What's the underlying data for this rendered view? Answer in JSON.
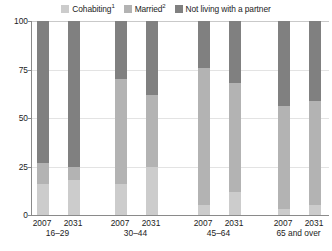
{
  "legend": {
    "items": [
      {
        "label": "Cohabiting",
        "sup": "1",
        "color": "#cccccc",
        "key": "cohabiting"
      },
      {
        "label": "Married",
        "sup": "2",
        "color": "#b3b3b3",
        "key": "married"
      },
      {
        "label": "Not living with a partner",
        "sup": "",
        "color": "#808080",
        "key": "not_living"
      }
    ]
  },
  "axis": {
    "y_ticks": [
      "0",
      "25",
      "50",
      "75",
      "100"
    ],
    "y_min": 0,
    "y_max": 100
  },
  "groups": [
    {
      "age_label": "16–29",
      "bars": [
        {
          "year": "2007",
          "cohabiting": 16,
          "married": 11,
          "not_living": 73
        },
        {
          "year": "2031",
          "cohabiting": 18,
          "married": 7,
          "not_living": 75
        }
      ]
    },
    {
      "age_label": "30–44",
      "bars": [
        {
          "year": "2007",
          "cohabiting": 16,
          "married": 54,
          "not_living": 30
        },
        {
          "year": "2031",
          "cohabiting": 25,
          "married": 37,
          "not_living": 38
        }
      ]
    },
    {
      "age_label": "45–64",
      "bars": [
        {
          "year": "2007",
          "cohabiting": 5,
          "married": 71,
          "not_living": 24
        },
        {
          "year": "2031",
          "cohabiting": 12,
          "married": 56,
          "not_living": 32
        }
      ]
    },
    {
      "age_label": "65 and over",
      "bars": [
        {
          "year": "2007",
          "cohabiting": 3,
          "married": 53,
          "not_living": 44
        },
        {
          "year": "2031",
          "cohabiting": 5,
          "married": 54,
          "not_living": 41
        }
      ]
    }
  ],
  "chart_data": {
    "type": "bar",
    "subtype": "stacked-percentage",
    "title": "",
    "subtitle": "",
    "xlabel": "",
    "ylabel": "",
    "ylim": [
      0,
      100
    ],
    "yticks": [
      0,
      25,
      50,
      75,
      100
    ],
    "grid": true,
    "legend_position": "top",
    "categories": [
      "2007 16–29",
      "2031 16–29",
      "2007 30–44",
      "2031 30–44",
      "2007 45–64",
      "2031 45–64",
      "2007 65 and over",
      "2031 65 and over"
    ],
    "group_labels": [
      "16–29",
      "30–44",
      "45–64",
      "65 and over"
    ],
    "year_labels": [
      "2007",
      "2031",
      "2007",
      "2031",
      "2007",
      "2031",
      "2007",
      "2031"
    ],
    "series": [
      {
        "name": "Cohabiting",
        "color": "#cccccc",
        "values": [
          16,
          18,
          16,
          25,
          5,
          12,
          3,
          5
        ]
      },
      {
        "name": "Married",
        "color": "#b3b3b3",
        "values": [
          11,
          7,
          54,
          37,
          71,
          56,
          53,
          54
        ]
      },
      {
        "name": "Not living with a partner",
        "color": "#808080",
        "values": [
          73,
          75,
          30,
          38,
          24,
          32,
          44,
          41
        ]
      }
    ],
    "annotations": [
      "1",
      "2"
    ]
  },
  "colors": {
    "cohabiting": "#cccccc",
    "married": "#b3b3b3",
    "not_living": "#808080",
    "gridline": "#e3e3e3",
    "axis": "#8a8a8a",
    "text": "#1c1c1c",
    "background": "#ffffff"
  }
}
